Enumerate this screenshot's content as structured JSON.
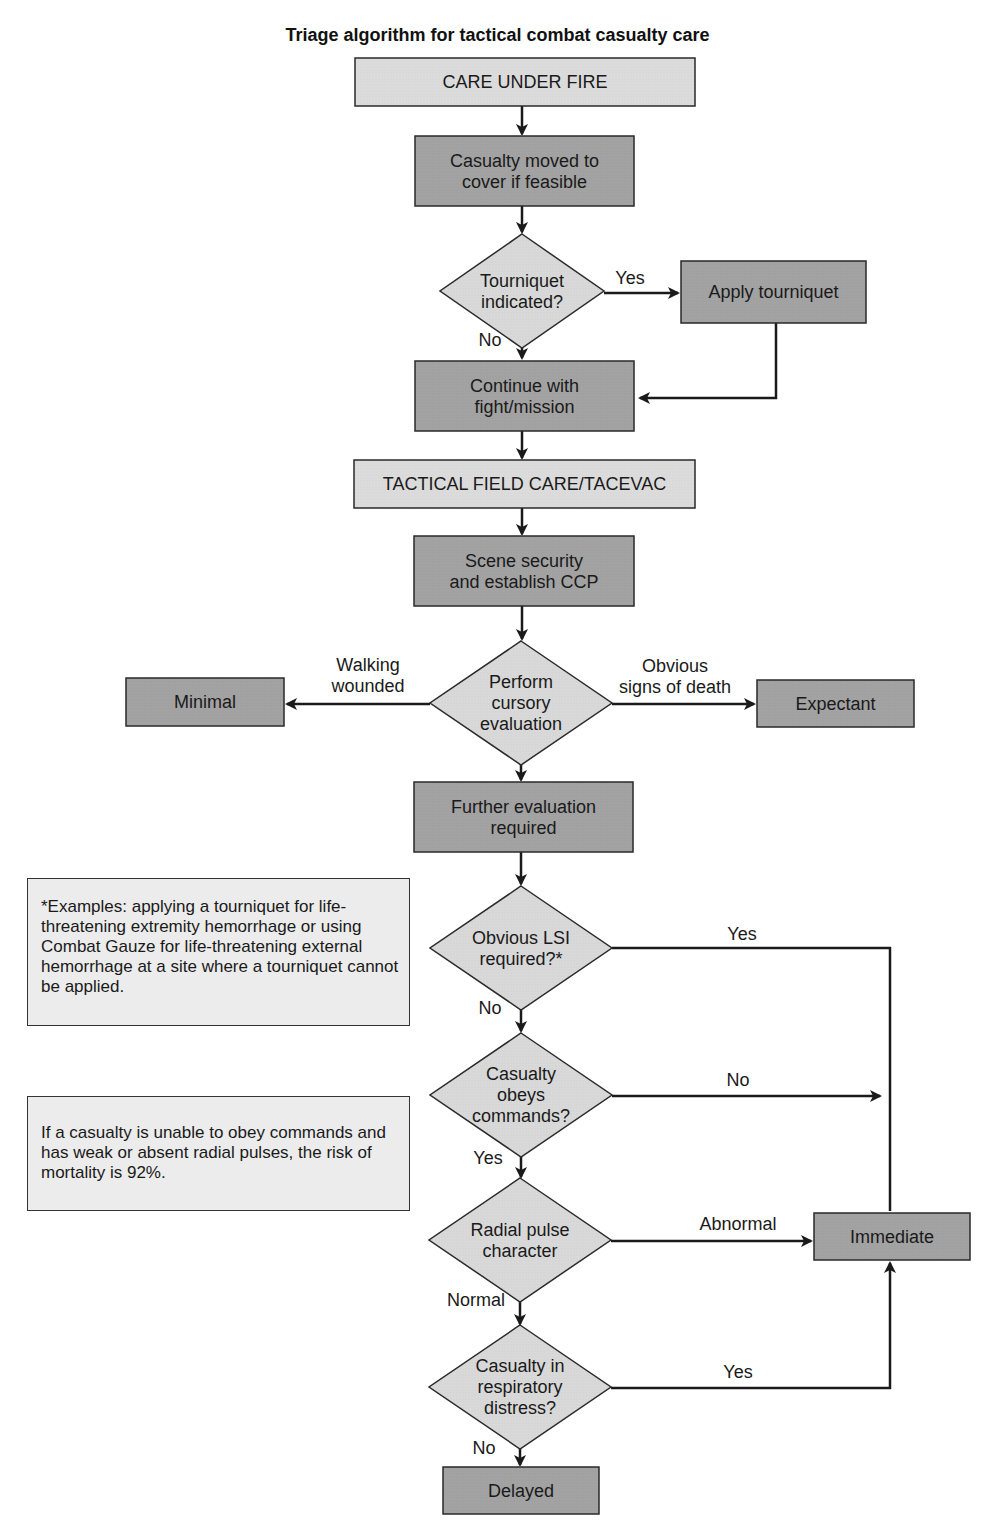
{
  "title": "Triage algorithm for tactical combat casualty care",
  "colors": {
    "phase_fill": "#dcdcdc",
    "action_fill": "#a3a3a3",
    "decision_fill": "#d9d9d9",
    "note_fill": "#ececec",
    "stroke": "#2a2a2a"
  },
  "nodes": [
    {
      "id": "care-under-fire",
      "type": "phase",
      "lines": [
        "CARE UNDER FIRE"
      ],
      "x": 355,
      "y": 58,
      "w": 340,
      "h": 48
    },
    {
      "id": "casualty-moved",
      "type": "action",
      "lines": [
        "Casualty moved to",
        "cover if feasible"
      ],
      "x": 415,
      "y": 136,
      "w": 219,
      "h": 70
    },
    {
      "id": "tourniquet-indicated",
      "type": "decision",
      "lines": [
        "Tourniquet",
        "indicated?"
      ],
      "cx": 522,
      "cy": 291,
      "hw": 82,
      "hh": 57
    },
    {
      "id": "apply-tourniquet",
      "type": "action",
      "lines": [
        "Apply tourniquet"
      ],
      "x": 681,
      "y": 261,
      "w": 185,
      "h": 62
    },
    {
      "id": "continue-fight",
      "type": "action",
      "lines": [
        "Continue with",
        "fight/mission"
      ],
      "x": 415,
      "y": 361,
      "w": 219,
      "h": 70
    },
    {
      "id": "tactical-field-care",
      "type": "phase",
      "lines": [
        "TACTICAL FIELD CARE/TACEVAC"
      ],
      "x": 354,
      "y": 460,
      "w": 341,
      "h": 48
    },
    {
      "id": "scene-security",
      "type": "action",
      "lines": [
        "Scene security",
        "and establish CCP"
      ],
      "x": 414,
      "y": 536,
      "w": 220,
      "h": 70
    },
    {
      "id": "cursory-evaluation",
      "type": "decision",
      "lines": [
        "Perform",
        "cursory",
        "evaluation"
      ],
      "cx": 521,
      "cy": 703,
      "hw": 91,
      "hh": 62
    },
    {
      "id": "minimal",
      "type": "action",
      "lines": [
        "Minimal"
      ],
      "x": 126,
      "y": 678,
      "w": 158,
      "h": 48
    },
    {
      "id": "expectant",
      "type": "action",
      "lines": [
        "Expectant"
      ],
      "x": 757,
      "y": 680,
      "w": 157,
      "h": 47
    },
    {
      "id": "further-evaluation",
      "type": "action",
      "lines": [
        "Further evaluation",
        "required"
      ],
      "x": 414,
      "y": 782,
      "w": 219,
      "h": 70
    },
    {
      "id": "obvious-lsi",
      "type": "decision",
      "lines": [
        "Obvious LSI",
        "required?*"
      ],
      "cx": 521,
      "cy": 948,
      "hw": 91,
      "hh": 62
    },
    {
      "id": "obeys-commands",
      "type": "decision",
      "lines": [
        "Casualty",
        "obeys",
        "commands?"
      ],
      "cx": 521,
      "cy": 1095,
      "hw": 91,
      "hh": 62
    },
    {
      "id": "radial-pulse",
      "type": "decision",
      "lines": [
        "Radial pulse",
        "character"
      ],
      "cx": 520,
      "cy": 1240,
      "hw": 91,
      "hh": 62
    },
    {
      "id": "immediate",
      "type": "action",
      "lines": [
        "Immediate"
      ],
      "x": 814,
      "y": 1213,
      "w": 156,
      "h": 47
    },
    {
      "id": "respiratory-distress",
      "type": "decision",
      "lines": [
        "Casualty in",
        "respiratory",
        "distress?"
      ],
      "cx": 520,
      "cy": 1387,
      "hw": 91,
      "hh": 62
    },
    {
      "id": "delayed",
      "type": "action",
      "lines": [
        "Delayed"
      ],
      "x": 443,
      "y": 1467,
      "w": 156,
      "h": 47
    }
  ],
  "edges": [
    {
      "points": [
        [
          522,
          106
        ],
        [
          522,
          134
        ]
      ],
      "arrow": true
    },
    {
      "points": [
        [
          522,
          206
        ],
        [
          522,
          232
        ]
      ],
      "arrow": true
    },
    {
      "points": [
        [
          604,
          293
        ],
        [
          678,
          293
        ]
      ],
      "arrow": true,
      "label": "Yes",
      "lx": 630,
      "ly": 284
    },
    {
      "points": [
        [
          522,
          348
        ],
        [
          522,
          358
        ]
      ],
      "arrow": true,
      "label": "No",
      "lx": 490,
      "ly": 346
    },
    {
      "points": [
        [
          776,
          323
        ],
        [
          776,
          398
        ],
        [
          640,
          398
        ]
      ],
      "arrow": true
    },
    {
      "points": [
        [
          522,
          431
        ],
        [
          522,
          458
        ]
      ],
      "arrow": true
    },
    {
      "points": [
        [
          522,
          508
        ],
        [
          522,
          534
        ]
      ],
      "arrow": true
    },
    {
      "points": [
        [
          522,
          606
        ],
        [
          522,
          639
        ]
      ],
      "arrow": true
    },
    {
      "points": [
        [
          430,
          704
        ],
        [
          287,
          704
        ]
      ],
      "arrow": true,
      "label": "Walking",
      "lx": 368,
      "ly": 671,
      "label2": "wounded",
      "lx2": 368,
      "ly2": 692
    },
    {
      "points": [
        [
          612,
          704
        ],
        [
          754,
          704
        ]
      ],
      "arrow": true,
      "label": "Obvious",
      "lx": 675,
      "ly": 672,
      "label2": "signs of death",
      "lx2": 675,
      "ly2": 693
    },
    {
      "points": [
        [
          521,
          765
        ],
        [
          521,
          780
        ]
      ],
      "arrow": true
    },
    {
      "points": [
        [
          521,
          852
        ],
        [
          521,
          884
        ]
      ],
      "arrow": true
    },
    {
      "points": [
        [
          612,
          948
        ],
        [
          890,
          948
        ],
        [
          890,
          1211
        ]
      ],
      "arrow": false,
      "label": "Yes",
      "lx": 742,
      "ly": 940
    },
    {
      "points": [
        [
          521,
          1010
        ],
        [
          521,
          1031
        ]
      ],
      "arrow": true,
      "label": "No",
      "lx": 490,
      "ly": 1014
    },
    {
      "points": [
        [
          612,
          1096
        ],
        [
          880,
          1096
        ]
      ],
      "arrow": true,
      "label": "No",
      "lx": 738,
      "ly": 1086
    },
    {
      "points": [
        [
          521,
          1157
        ],
        [
          521,
          1177
        ]
      ],
      "arrow": true,
      "label": "Yes",
      "lx": 488,
      "ly": 1164
    },
    {
      "points": [
        [
          611,
          1241
        ],
        [
          811,
          1241
        ]
      ],
      "arrow": true,
      "label": "Abnormal",
      "lx": 738,
      "ly": 1230
    },
    {
      "points": [
        [
          520,
          1302
        ],
        [
          520,
          1324
        ]
      ],
      "arrow": true,
      "label": "Normal",
      "lx": 476,
      "ly": 1306
    },
    {
      "points": [
        [
          611,
          1388
        ],
        [
          890,
          1388
        ],
        [
          890,
          1263
        ]
      ],
      "arrow": true,
      "label": "Yes",
      "lx": 738,
      "ly": 1378
    },
    {
      "points": [
        [
          520,
          1449
        ],
        [
          520,
          1465
        ]
      ],
      "arrow": true,
      "label": "No",
      "lx": 484,
      "ly": 1454
    }
  ],
  "notes": [
    {
      "id": "lsi-examples-note",
      "text": "*Examples: applying a tourniquet for life-threatening extremity hemorrhage or using Combat Gauze for life-threatening external hemorrhage at a site where a tourniquet cannot be applied.",
      "x": 27,
      "y": 878,
      "w": 383,
      "h": 148
    },
    {
      "id": "mortality-note",
      "text": "If a casualty is unable to obey commands and has weak or absent radial pulses, the risk of mortality is 92%.",
      "x": 27,
      "y": 1096,
      "w": 383,
      "h": 115
    }
  ]
}
